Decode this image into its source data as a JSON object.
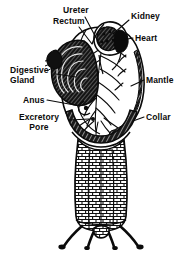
{
  "figure": {
    "background_color": "#ffffff",
    "ink_color": "#0b0b0b",
    "width": 187,
    "height": 255
  },
  "labels": {
    "ureter": "Ureter",
    "rectum": "Rectum",
    "kidney": "Kidney",
    "heart": "Heart",
    "digestive_gland_line1": "Digestive",
    "digestive_gland_line2": "Gland",
    "anus": "Anus",
    "excretory_pore_line1": "Excretory",
    "excretory_pore_line2": "Pore",
    "mantle": "Mantle",
    "collar": "Collar"
  },
  "parts": [
    {
      "name": "ureter",
      "side": "top-left",
      "label": "Ureter"
    },
    {
      "name": "rectum",
      "side": "top-left",
      "label": "Rectum"
    },
    {
      "name": "kidney",
      "side": "top-right",
      "label": "Kidney"
    },
    {
      "name": "heart",
      "side": "top-right",
      "label": "Heart"
    },
    {
      "name": "digestive-gland",
      "side": "left",
      "label": "Digestive Gland"
    },
    {
      "name": "anus",
      "side": "left",
      "label": "Anus"
    },
    {
      "name": "excretory-pore",
      "side": "lower-left",
      "label": "Excretory Pore"
    },
    {
      "name": "mantle",
      "side": "right",
      "label": "Mantle"
    },
    {
      "name": "collar",
      "side": "lower-right",
      "label": "Collar"
    }
  ]
}
